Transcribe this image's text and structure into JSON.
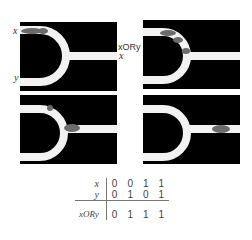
{
  "panels": [
    {
      "id": "top-left",
      "stage": "input",
      "labels": {
        "in1": "x",
        "in2": "y",
        "out": "x"
      }
    },
    {
      "id": "top-right",
      "stage": "transit",
      "labels": {
        "out": "xORy"
      }
    },
    {
      "id": "bottom-left",
      "stage": "merging",
      "labels": {}
    },
    {
      "id": "bottom-right",
      "stage": "output",
      "labels": {}
    }
  ],
  "truth_table": {
    "rows": [
      {
        "label": "x",
        "values": [
          "0",
          "0",
          "1",
          "1"
        ]
      },
      {
        "label": "y",
        "values": [
          "0",
          "1",
          "0",
          "1"
        ]
      }
    ],
    "result": {
      "label": "xORy",
      "values": [
        "0",
        "1",
        "1",
        "1"
      ]
    }
  },
  "colors": {
    "channel": "#f2f2f2",
    "background": "#000000",
    "particles": "#6b6b6b"
  }
}
